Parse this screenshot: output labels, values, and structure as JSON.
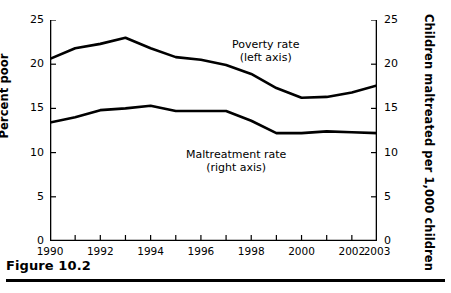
{
  "figure": {
    "caption": "Figure 10.2"
  },
  "chart_data": {
    "type": "line",
    "title": "",
    "xlabel": "",
    "ylabel": "Percent poor",
    "y2label": "Children maltreated per 1,000 children",
    "xlim": [
      1990,
      2003
    ],
    "ylim": [
      0,
      25
    ],
    "y2lim": [
      0,
      25
    ],
    "grid": false,
    "legend_position": "inline-annotation",
    "x": [
      1990,
      1991,
      1992,
      1993,
      1994,
      1995,
      1996,
      1997,
      1998,
      1999,
      2000,
      2001,
      2002,
      2003
    ],
    "x_tick_values": [
      1990,
      1991,
      1992,
      1993,
      1994,
      1995,
      1996,
      1997,
      1998,
      1999,
      2000,
      2001,
      2002,
      2003
    ],
    "x_tick_labels": [
      "1990",
      "",
      "1992",
      "",
      "1994",
      "",
      "1996",
      "",
      "1998",
      "",
      "2000",
      "",
      "2002",
      "2003"
    ],
    "y_tick_values": [
      0,
      5,
      10,
      15,
      20,
      25
    ],
    "y_tick_labels": [
      "0",
      "5",
      "10",
      "15",
      "20",
      "25"
    ],
    "y2_tick_values": [
      0,
      5,
      10,
      15,
      20,
      25
    ],
    "y2_tick_labels": [
      "0",
      "5",
      "10",
      "15",
      "20",
      "25"
    ],
    "series": [
      {
        "name": "Poverty rate",
        "axis": "left",
        "annotation_line1": "Poverty rate",
        "annotation_line2": "(left axis)",
        "color": "#000000",
        "values": [
          20.6,
          21.8,
          22.3,
          23.0,
          21.8,
          20.8,
          20.5,
          19.9,
          18.9,
          17.3,
          16.2,
          16.3,
          16.8,
          17.6
        ]
      },
      {
        "name": "Maltreatment rate",
        "axis": "right",
        "annotation_line1": "Maltreatment rate",
        "annotation_line2": "(right axis)",
        "color": "#000000",
        "values": [
          13.4,
          14.0,
          14.8,
          15.0,
          15.3,
          14.7,
          14.7,
          14.7,
          13.6,
          12.2,
          12.2,
          12.4,
          12.3,
          12.2
        ]
      }
    ]
  }
}
